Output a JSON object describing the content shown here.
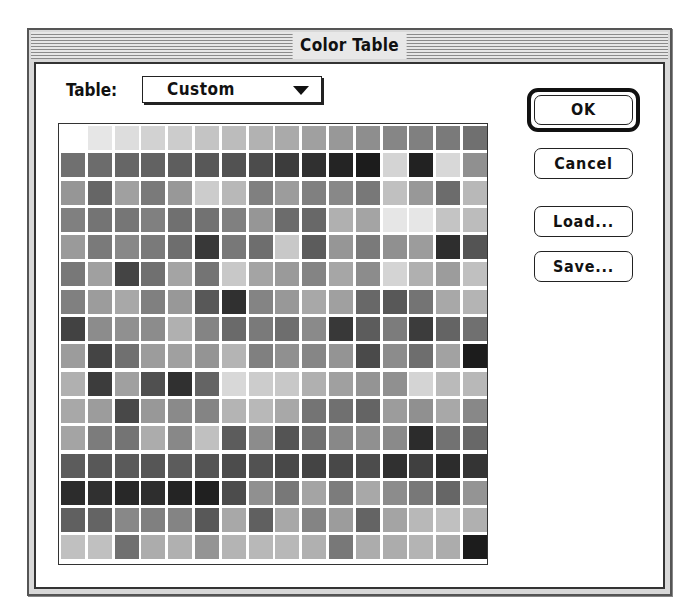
{
  "window": {
    "title": "Color Table"
  },
  "table_selector": {
    "label": "Table:",
    "selected": "Custom",
    "arrow_icon": "triangle-down"
  },
  "buttons": {
    "ok": "OK",
    "cancel": "Cancel",
    "load": "Load...",
    "save": "Save..."
  },
  "grid": {
    "rows": 16,
    "columns": 16,
    "cells": [
      [
        "#ffffff",
        "#e6e6e6",
        "#dddddd",
        "#d2d2d2",
        "#cccccc",
        "#c4c4c4",
        "#bcbcbc",
        "#b2b2b2",
        "#aaaaaa",
        "#a0a0a0",
        "#989898",
        "#8e8e8e",
        "#868686",
        "#808080",
        "#7a7a7a",
        "#707070"
      ],
      [
        "#707070",
        "#6c6c6c",
        "#666666",
        "#626262",
        "#5e5e5e",
        "#585858",
        "#525252",
        "#4c4c4c",
        "#3c3c3c",
        "#303030",
        "#242424",
        "#1c1c1c",
        "#d4d4d4",
        "#222222",
        "#d8d8d8",
        "#909090"
      ],
      [
        "#969696",
        "#666666",
        "#a0a0a0",
        "#7a7a7a",
        "#989898",
        "#cccccc",
        "#b8b8b8",
        "#808080",
        "#9c9c9c",
        "#808080",
        "#888888",
        "#787878",
        "#c0c0c0",
        "#989898",
        "#6c6c6c",
        "#b8b8b8"
      ],
      [
        "#808080",
        "#747474",
        "#767676",
        "#808080",
        "#707070",
        "#727272",
        "#808080",
        "#969696",
        "#6c6c6c",
        "#686868",
        "#b0b0b0",
        "#a4a4a4",
        "#e6e6e6",
        "#e6e6e6",
        "#c4c4c4",
        "#bcbcbc"
      ],
      [
        "#9a9a9a",
        "#7a7a7a",
        "#888888",
        "#7a7a7a",
        "#6e6e6e",
        "#383838",
        "#787878",
        "#6e6e6e",
        "#c8c8c8",
        "#5c5c5c",
        "#969696",
        "#7a7a7a",
        "#909090",
        "#9c9c9c",
        "#2e2e2e",
        "#545454"
      ],
      [
        "#787878",
        "#a0a0a0",
        "#444444",
        "#707070",
        "#a4a4a4",
        "#747474",
        "#c8c8c8",
        "#a4a4a4",
        "#9a9a9a",
        "#848484",
        "#a6a6a6",
        "#8c8c8c",
        "#d4d4d4",
        "#b0b0b0",
        "#9c9c9c",
        "#c0c0c0"
      ],
      [
        "#808080",
        "#9c9c9c",
        "#a8a8a8",
        "#808080",
        "#989898",
        "#585858",
        "#303030",
        "#848484",
        "#989898",
        "#a8a8a8",
        "#a0a0a0",
        "#686868",
        "#585858",
        "#747474",
        "#a8a8a8",
        "#b4b4b4"
      ],
      [
        "#424242",
        "#8c8c8c",
        "#909090",
        "#8c8c8c",
        "#b0b0b0",
        "#848484",
        "#6a6a6a",
        "#7a7a7a",
        "#6e6e6e",
        "#8a8a8a",
        "#383838",
        "#5c5c5c",
        "#7c7c7c",
        "#3c3c3c",
        "#646464",
        "#707070"
      ],
      [
        "#9c9c9c",
        "#444444",
        "#707070",
        "#9c9c9c",
        "#a0a0a0",
        "#949494",
        "#b4b4b4",
        "#808080",
        "#909090",
        "#868686",
        "#949494",
        "#4a4a4a",
        "#8c8c8c",
        "#6e6e6e",
        "#a2a2a2",
        "#1c1c1c"
      ],
      [
        "#b0b0b0",
        "#3c3c3c",
        "#a0a0a0",
        "#505050",
        "#303030",
        "#646464",
        "#d8d8d8",
        "#cccccc",
        "#c8c8c8",
        "#b0b0b0",
        "#a0a0a0",
        "#949494",
        "#909090",
        "#d4d4d4",
        "#bababa",
        "#b8b8b8"
      ],
      [
        "#a8a8a8",
        "#9c9c9c",
        "#484848",
        "#989898",
        "#8a8a8a",
        "#848484",
        "#b4b4b4",
        "#b8b8b8",
        "#a8a8a8",
        "#747474",
        "#707070",
        "#646464",
        "#9c9c9c",
        "#909090",
        "#a8a8a8",
        "#888888"
      ],
      [
        "#a4a4a4",
        "#7c7c7c",
        "#747474",
        "#acacac",
        "#888888",
        "#c0c0c0",
        "#5c5c5c",
        "#8c8c8c",
        "#545454",
        "#707070",
        "#888888",
        "#909090",
        "#8a8a8a",
        "#2c2c2c",
        "#727272",
        "#686868"
      ],
      [
        "#5c5c5c",
        "#585858",
        "#5a5a5a",
        "#565656",
        "#5c5c5c",
        "#545454",
        "#4c4c4c",
        "#525252",
        "#484848",
        "#444444",
        "#484848",
        "#4c4c4c",
        "#303030",
        "#404040",
        "#2c2c2c",
        "#343434"
      ],
      [
        "#2c2c2c",
        "#303030",
        "#282828",
        "#2e2e2e",
        "#242424",
        "#202020",
        "#4c4c4c",
        "#909090",
        "#787878",
        "#a4a4a4",
        "#7c7c7c",
        "#a8a8a8",
        "#8c8c8c",
        "#787878",
        "#666666",
        "#949494"
      ],
      [
        "#606060",
        "#646464",
        "#888888",
        "#808080",
        "#848484",
        "#585858",
        "#a8a8a8",
        "#606060",
        "#a8a8a8",
        "#848484",
        "#9c9c9c",
        "#646464",
        "#a4a4a4",
        "#b8b8b8",
        "#c0c0c0",
        "#b0b0b0"
      ],
      [
        "#c0c0c0",
        "#c0c0c0",
        "#707070",
        "#acacac",
        "#b0b0b0",
        "#949494",
        "#b4b4b4",
        "#b8b8b8",
        "#b8b8b8",
        "#b0b0b0",
        "#787878",
        "#acacac",
        "#acacac",
        "#b4b4b4",
        "#acacac",
        "#1c1c1c"
      ]
    ]
  }
}
